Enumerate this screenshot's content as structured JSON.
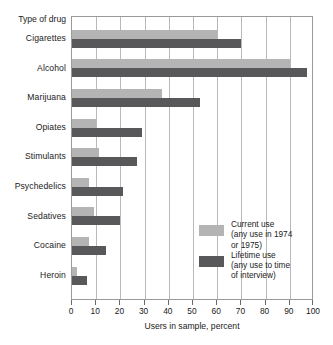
{
  "chart_data": {
    "type": "bar",
    "orientation": "horizontal",
    "title": "",
    "subtitle": "",
    "category_axis_title": "Type of drug",
    "xlabel": "Users in sample, percent",
    "ylabel": "",
    "xlim": [
      0,
      100
    ],
    "xticks": [
      0,
      10,
      20,
      30,
      40,
      50,
      60,
      70,
      80,
      90,
      100
    ],
    "xticklabels": [
      "0",
      "10",
      "20",
      "30",
      "40",
      "50",
      "60",
      "70",
      "80",
      "90",
      "100"
    ],
    "grid": "vertical",
    "legend_position": "inside-lower-right",
    "categories": [
      "Cigarettes",
      "Alcohol",
      "Marijuana",
      "Opiates",
      "Stimulants",
      "Psychedelics",
      "Sedatives",
      "Cocaine",
      "Heroin"
    ],
    "series": [
      {
        "name": "Current use",
        "legend_label": "Current use\n(any use in 1974\nor 1975)",
        "color": "#b4b4b4",
        "values": [
          60,
          90,
          37,
          10,
          11,
          7,
          9,
          7,
          2
        ]
      },
      {
        "name": "Lifetime use",
        "legend_label": "Lifetime use\n(any use to time\nof interview)",
        "color": "#58585a",
        "values": [
          70,
          97,
          53,
          29,
          27,
          21,
          20,
          14,
          6
        ]
      }
    ]
  },
  "legend": {
    "entries": [
      {
        "label": "Current use\n(any use in 1974\nor 1975)",
        "color": "#b4b4b4"
      },
      {
        "label": "Lifetime use\n(any use to time\nof interview)",
        "color": "#58585a"
      }
    ]
  },
  "axis": {
    "x_title": "Users in sample, percent",
    "category_header": "Type of drug"
  },
  "colors": {
    "current": "#b4b4b4",
    "lifetime": "#58585a",
    "gridline": "#b9b9b9",
    "frame": "#9a9a9a",
    "text": "#1b1b1b",
    "background": "#ffffff"
  }
}
